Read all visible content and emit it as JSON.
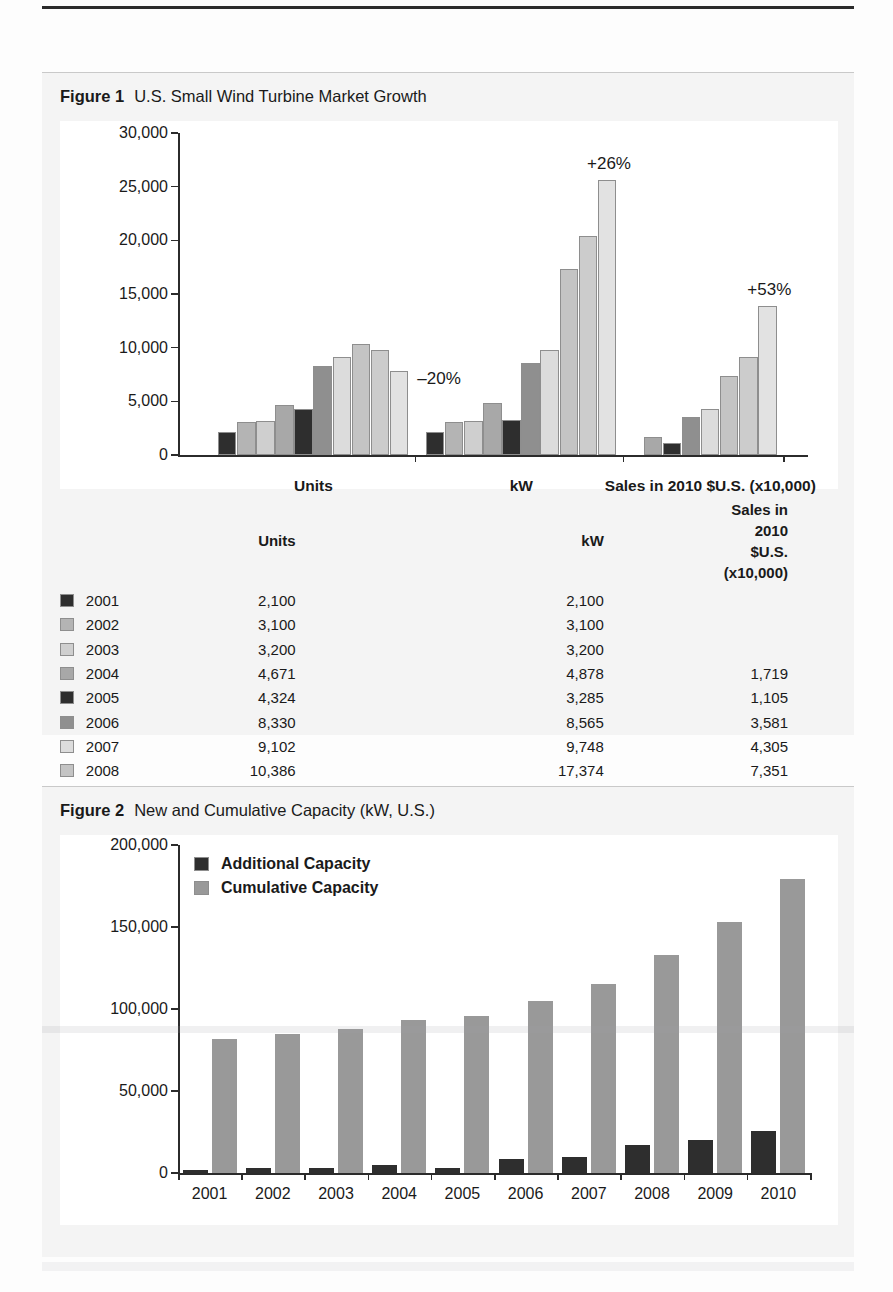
{
  "figure1": {
    "caption_number": "Figure 1",
    "caption_title": "U.S. Small Wind Turbine Market Growth",
    "yaxis": {
      "ticks": [
        "30,000",
        "25,000",
        "20,000",
        "15,000",
        "10,000",
        "5,000",
        "0"
      ],
      "min": 0,
      "max": 30000
    },
    "group_labels": [
      "Units",
      "kW",
      "Sales in 2010 $U.S. (x10,000)"
    ],
    "annotations": [
      {
        "text": "–20%",
        "group": "Units"
      },
      {
        "text": "+26%",
        "group": "kW"
      },
      {
        "text": "+53%",
        "group": "Sales"
      }
    ],
    "table": {
      "headers": [
        "",
        "",
        "Units",
        "kW",
        "Sales in 2010 $U.S. (x10,000)"
      ],
      "rows": [
        {
          "year": "2001",
          "units": "2,100",
          "kw": "2,100",
          "sales": "",
          "color": "#2e2e2e"
        },
        {
          "year": "2002",
          "units": "3,100",
          "kw": "3,100",
          "sales": "",
          "color": "#b4b4b4"
        },
        {
          "year": "2003",
          "units": "3,200",
          "kw": "3,200",
          "sales": "",
          "color": "#cfcfcf"
        },
        {
          "year": "2004",
          "units": "4,671",
          "kw": "4,878",
          "sales": "1,719",
          "color": "#a8a8a8"
        },
        {
          "year": "2005",
          "units": "4,324",
          "kw": "3,285",
          "sales": "1,105",
          "color": "#2e2e2e"
        },
        {
          "year": "2006",
          "units": "8,330",
          "kw": "8,565",
          "sales": "3,581",
          "color": "#8f8f8f"
        },
        {
          "year": "2007",
          "units": "9,102",
          "kw": "9,748",
          "sales": "4,305",
          "color": "#dcdcdc"
        },
        {
          "year": "2008",
          "units": "10,386",
          "kw": "17,374",
          "sales": "7,351",
          "color": "#c4c4c4"
        },
        {
          "year": "2009",
          "units": "9,820",
          "kw": "20,375",
          "sales": "9,096",
          "color": "#cccccc"
        },
        {
          "year": "2010",
          "units": "7,811",
          "kw": "25,618",
          "sales": "13,922",
          "color": "#e2e2e2"
        }
      ]
    }
  },
  "figure2": {
    "caption_number": "Figure 2",
    "caption_title": "New and Cumulative Capacity (kW, U.S.)",
    "legend": [
      {
        "label": "Additional Capacity",
        "color": "#2e2e2e"
      },
      {
        "label": "Cumulative Capacity",
        "color": "#999999"
      }
    ],
    "yaxis": {
      "ticks": [
        "200,000",
        "150,000",
        "100,000",
        "50,000",
        "0"
      ],
      "min": 0,
      "max": 200000
    },
    "xaxis": {
      "labels": [
        "2001",
        "2002",
        "2003",
        "2004",
        "2005",
        "2006",
        "2007",
        "2008",
        "2009",
        "2010"
      ]
    }
  },
  "chart_data": [
    {
      "type": "bar",
      "title": "U.S. Small Wind Turbine Market Growth",
      "xlabel": "",
      "ylabel": "",
      "ylim": [
        0,
        30000
      ],
      "grid": false,
      "legend_position": "below-as-table",
      "categories": [
        "2001",
        "2002",
        "2003",
        "2004",
        "2005",
        "2006",
        "2007",
        "2008",
        "2009",
        "2010"
      ],
      "groups": [
        "Units",
        "kW",
        "Sales in 2010 $U.S. (x10,000)"
      ],
      "series": [
        {
          "name": "Units",
          "values": [
            2100,
            3100,
            3200,
            4671,
            4324,
            8330,
            9102,
            10386,
            9820,
            7811
          ]
        },
        {
          "name": "kW",
          "values": [
            2100,
            3100,
            3200,
            4878,
            3285,
            8565,
            9748,
            17374,
            20375,
            25618
          ]
        },
        {
          "name": "Sales in 2010 $U.S. (x10,000)",
          "values": [
            null,
            null,
            null,
            1719,
            1105,
            3581,
            4305,
            7351,
            9096,
            13922
          ]
        }
      ],
      "annotations": [
        {
          "text": "–20%",
          "series": "Units",
          "category": "2010"
        },
        {
          "text": "+26%",
          "series": "kW",
          "category": "2010"
        },
        {
          "text": "+53%",
          "series": "Sales in 2010 $U.S. (x10,000)",
          "category": "2010"
        }
      ]
    },
    {
      "type": "bar",
      "title": "New and Cumulative Capacity (kW, U.S.)",
      "xlabel": "",
      "ylabel": "",
      "ylim": [
        0,
        200000
      ],
      "grid": false,
      "legend_position": "top-left-inside",
      "categories": [
        "2001",
        "2002",
        "2003",
        "2004",
        "2005",
        "2006",
        "2007",
        "2008",
        "2009",
        "2010"
      ],
      "series": [
        {
          "name": "Additional Capacity",
          "values": [
            2100,
            3100,
            3200,
            4878,
            3285,
            8565,
            9748,
            17374,
            20375,
            25618
          ]
        },
        {
          "name": "Cumulative Capacity",
          "values": [
            82000,
            85000,
            88000,
            93000,
            96000,
            105000,
            115000,
            133000,
            153000,
            179000
          ]
        }
      ]
    }
  ]
}
